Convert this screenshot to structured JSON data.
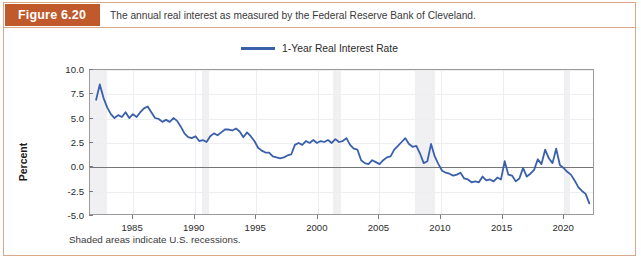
{
  "figure": {
    "tag": "Figure 6.20",
    "caption": "The annual real interest as measured by the Federal Reserve Bank of Cleveland.",
    "footnote": "Shaded areas indicate U.S. recessions.",
    "accent_color": "#c05a2d",
    "border_color": "#d9a78a"
  },
  "chart_data": {
    "type": "line",
    "title": "",
    "xlabel": "",
    "ylabel": "Percent",
    "xlim": [
      1981.5,
      2022.5
    ],
    "ylim": [
      -5.0,
      10.0
    ],
    "yticks": [
      10.0,
      7.5,
      5.0,
      2.5,
      0.0,
      -2.5,
      -5.0
    ],
    "ytick_labels": [
      "10.0",
      "7.5",
      "5.0",
      "2.5",
      "0.0",
      "-2.5",
      "-5.0"
    ],
    "xticks": [
      1985,
      1990,
      1995,
      2000,
      2005,
      2010,
      2015,
      2020
    ],
    "xtick_labels": [
      "1985",
      "1990",
      "1995",
      "2000",
      "2005",
      "2010",
      "2015",
      "2020"
    ],
    "grid": true,
    "zero_line": 0.0,
    "legend_position": "top-center",
    "line_color": "#3a5fab",
    "line_width": 1.8,
    "recession_color": "#f0f0f2",
    "recessions": [
      {
        "start": 1981.5,
        "end": 1982.9
      },
      {
        "start": 1990.6,
        "end": 1991.2
      },
      {
        "start": 2001.2,
        "end": 2001.9
      },
      {
        "start": 2007.9,
        "end": 2009.5
      },
      {
        "start": 2020.1,
        "end": 2020.5
      }
    ],
    "series": [
      {
        "name": "1-Year Real Interest Rate",
        "x": [
          1982.0,
          1982.3,
          1982.6,
          1982.9,
          1983.2,
          1983.5,
          1983.8,
          1984.1,
          1984.4,
          1984.7,
          1985.0,
          1985.3,
          1985.6,
          1985.9,
          1986.2,
          1986.5,
          1986.8,
          1987.1,
          1987.4,
          1987.7,
          1988.0,
          1988.3,
          1988.6,
          1988.9,
          1989.2,
          1989.5,
          1989.8,
          1990.1,
          1990.4,
          1990.7,
          1991.0,
          1991.3,
          1991.6,
          1991.9,
          1992.2,
          1992.5,
          1992.8,
          1993.1,
          1993.4,
          1993.7,
          1994.0,
          1994.3,
          1994.6,
          1994.9,
          1995.2,
          1995.5,
          1995.8,
          1996.1,
          1996.4,
          1996.7,
          1997.0,
          1997.3,
          1997.6,
          1997.9,
          1998.2,
          1998.5,
          1998.8,
          1999.1,
          1999.4,
          1999.7,
          2000.0,
          2000.3,
          2000.6,
          2000.9,
          2001.2,
          2001.5,
          2001.8,
          2002.1,
          2002.4,
          2002.7,
          2003.0,
          2003.3,
          2003.6,
          2003.9,
          2004.2,
          2004.5,
          2004.8,
          2005.1,
          2005.4,
          2005.7,
          2006.0,
          2006.3,
          2006.6,
          2006.9,
          2007.2,
          2007.5,
          2007.8,
          2008.1,
          2008.4,
          2008.7,
          2009.0,
          2009.3,
          2009.6,
          2009.9,
          2010.2,
          2010.5,
          2010.8,
          2011.1,
          2011.4,
          2011.7,
          2012.0,
          2012.3,
          2012.6,
          2012.9,
          2013.2,
          2013.5,
          2013.8,
          2014.1,
          2014.4,
          2014.7,
          2015.0,
          2015.3,
          2015.6,
          2015.9,
          2016.2,
          2016.5,
          2016.8,
          2017.1,
          2017.4,
          2017.7,
          2018.0,
          2018.3,
          2018.6,
          2018.9,
          2019.2,
          2019.5,
          2019.8,
          2020.1,
          2020.4,
          2020.7,
          2021.0,
          2021.3,
          2021.6,
          2021.9,
          2022.2
        ],
        "values": [
          6.9,
          8.5,
          7.1,
          6.1,
          5.4,
          5.0,
          5.3,
          5.1,
          5.6,
          5.0,
          5.4,
          5.1,
          5.6,
          6.0,
          6.2,
          5.6,
          5.0,
          4.9,
          4.6,
          4.8,
          4.6,
          5.0,
          4.7,
          4.1,
          3.4,
          3.0,
          2.9,
          3.1,
          2.6,
          2.7,
          2.5,
          3.1,
          3.4,
          3.2,
          3.5,
          3.8,
          3.8,
          3.7,
          3.9,
          3.6,
          3.0,
          3.5,
          3.1,
          2.6,
          1.9,
          1.6,
          1.4,
          1.4,
          1.0,
          0.9,
          0.8,
          0.9,
          1.1,
          1.2,
          2.2,
          2.4,
          2.2,
          2.6,
          2.4,
          2.7,
          2.4,
          2.6,
          2.5,
          2.7,
          2.4,
          2.8,
          2.5,
          2.6,
          2.9,
          2.2,
          1.8,
          1.7,
          0.6,
          0.3,
          0.2,
          0.6,
          0.4,
          0.2,
          0.6,
          0.9,
          1.0,
          1.7,
          2.1,
          2.5,
          2.9,
          2.3,
          2.0,
          2.1,
          1.3,
          0.3,
          0.5,
          2.3,
          1.0,
          0.2,
          -0.5,
          -0.7,
          -0.8,
          -1.0,
          -0.9,
          -0.7,
          -1.3,
          -1.4,
          -1.7,
          -1.6,
          -1.7,
          -1.1,
          -1.5,
          -1.4,
          -1.6,
          -1.2,
          -1.4,
          0.5,
          -0.9,
          -1.0,
          -1.6,
          -1.3,
          -0.2,
          -1.1,
          -0.8,
          -0.4,
          0.7,
          0.2,
          1.7,
          0.8,
          0.3,
          1.8,
          0.1,
          -0.2,
          -0.6,
          -0.9,
          -1.5,
          -2.2,
          -2.6,
          -2.9,
          -3.9
        ]
      }
    ]
  }
}
